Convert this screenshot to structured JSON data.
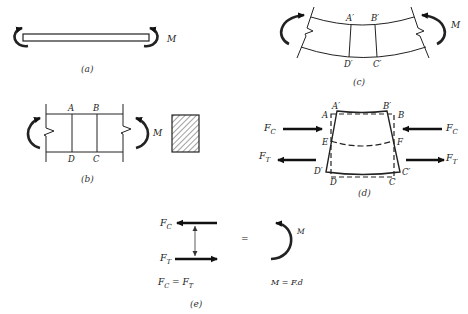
{
  "figure": {
    "panels": {
      "a": {
        "caption": "(a)",
        "moment_label": "M"
      },
      "b": {
        "caption": "(b)",
        "moment_label": "M",
        "points": {
          "A": "A",
          "B": "B",
          "C": "C",
          "D": "D"
        },
        "cross_section": "hatched rectangle"
      },
      "c": {
        "caption": "(c)",
        "moment_label": "M",
        "points": {
          "A": "A′",
          "B": "B′",
          "C": "C′",
          "D": "D′"
        }
      },
      "d": {
        "caption": "(d)",
        "points": {
          "A_prime": "A′",
          "B_prime": "B′",
          "A": "A",
          "B": "B",
          "E": "E",
          "F": "F",
          "D_prime": "D′",
          "C_prime": "C′",
          "D": "D",
          "C": "C"
        },
        "forces": {
          "compression": {
            "base": "F",
            "sub": "C"
          },
          "tension": {
            "base": "F",
            "sub": "T"
          }
        }
      },
      "e": {
        "caption": "(e)",
        "force_top": {
          "base": "F",
          "sub": "C"
        },
        "force_bottom": {
          "base": "F",
          "sub": "T"
        },
        "equals": "=",
        "moment_label": "M",
        "equation_left": {
          "lhs_base": "F",
          "lhs_sub": "C",
          "op": " = ",
          "rhs_base": "F",
          "rhs_sub": "T"
        },
        "equation_right": "M = F.d"
      }
    }
  }
}
